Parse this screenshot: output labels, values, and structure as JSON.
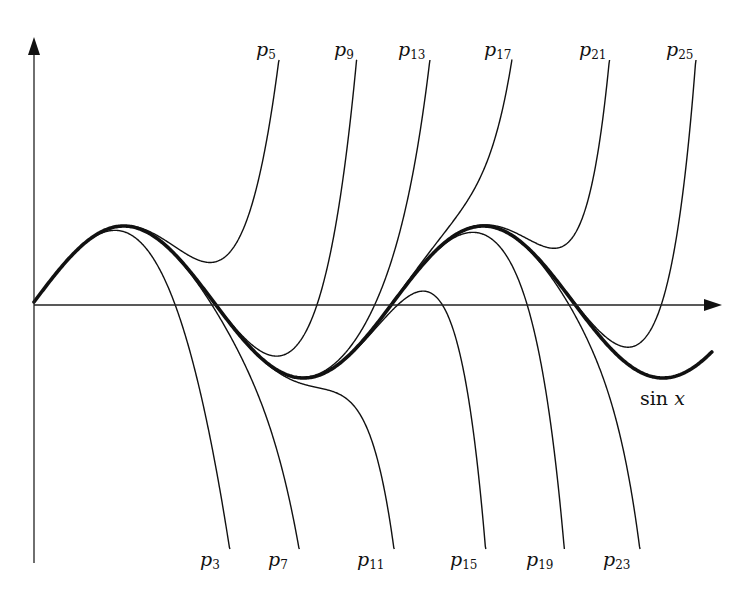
{
  "figure": {
    "curve_label": {
      "fn": "sin",
      "var": "x"
    },
    "top_labels": [
      {
        "name": "p",
        "sub": "5",
        "order": 5,
        "x": 256,
        "y": 40
      },
      {
        "name": "p",
        "sub": "9",
        "order": 9,
        "x": 334,
        "y": 40
      },
      {
        "name": "p",
        "sub": "13",
        "order": 13,
        "x": 398,
        "y": 40
      },
      {
        "name": "p",
        "sub": "17",
        "order": 17,
        "x": 484,
        "y": 40
      },
      {
        "name": "p",
        "sub": "21",
        "order": 21,
        "x": 579,
        "y": 40
      },
      {
        "name": "p",
        "sub": "25",
        "order": 25,
        "x": 666,
        "y": 40
      }
    ],
    "bottom_labels": [
      {
        "name": "p",
        "sub": "3",
        "order": 3,
        "x": 200,
        "y": 550
      },
      {
        "name": "p",
        "sub": "7",
        "order": 7,
        "x": 268,
        "y": 550
      },
      {
        "name": "p",
        "sub": "11",
        "order": 11,
        "x": 357,
        "y": 550
      },
      {
        "name": "p",
        "sub": "15",
        "order": 15,
        "x": 450,
        "y": 550
      },
      {
        "name": "p",
        "sub": "19",
        "order": 19,
        "x": 526,
        "y": 550
      },
      {
        "name": "p",
        "sub": "23",
        "order": 23,
        "x": 603,
        "y": 550
      }
    ],
    "sin_label_pos": {
      "x": 640,
      "y": 389
    }
  },
  "chart_data": {
    "type": "line",
    "xlabel": "",
    "ylabel": "",
    "grid": false,
    "legend": "inline labels",
    "x_range": [
      0,
      11.85
    ],
    "y_range": [
      -3.2,
      3.2
    ],
    "series": [
      {
        "name": "sin x",
        "kind": "function",
        "emphasis": "bold"
      },
      {
        "name": "p3",
        "order": 3
      },
      {
        "name": "p5",
        "order": 5
      },
      {
        "name": "p7",
        "order": 7
      },
      {
        "name": "p9",
        "order": 9
      },
      {
        "name": "p11",
        "order": 11
      },
      {
        "name": "p13",
        "order": 13
      },
      {
        "name": "p15",
        "order": 15
      },
      {
        "name": "p17",
        "order": 17
      },
      {
        "name": "p19",
        "order": 19
      },
      {
        "name": "p21",
        "order": 21
      },
      {
        "name": "p23",
        "order": 23
      },
      {
        "name": "p25",
        "order": 25
      }
    ],
    "annotations": [
      "p3",
      "p5",
      "p7",
      "p9",
      "p11",
      "p13",
      "p15",
      "p17",
      "p19",
      "p21",
      "p23",
      "p25",
      "sin x"
    ]
  },
  "geometry": {
    "origin": {
      "x": 34,
      "y": 302
    },
    "x_scale": 57.2,
    "y_scale": 76,
    "clip_top": 60,
    "clip_bottom": 549,
    "x_axis": {
      "x1": 34,
      "x2": 722,
      "y": 305
    },
    "y_axis": {
      "x": 34,
      "y1": 563,
      "y2": 37
    },
    "colors": {
      "stroke": "#111111",
      "axis": "#222222"
    }
  }
}
